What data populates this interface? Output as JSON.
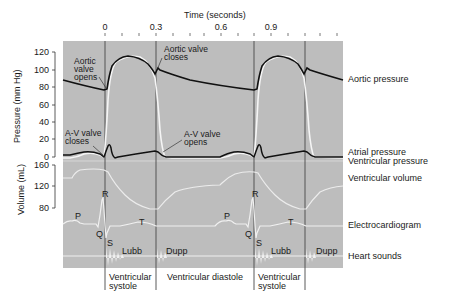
{
  "time_axis": {
    "label": "Time (seconds)",
    "ticks": [
      {
        "label": "0",
        "x": 105
      },
      {
        "label": "0.3",
        "x": 156
      },
      {
        "label": "0.6",
        "x": 221
      },
      {
        "label": "0.9",
        "x": 271
      }
    ]
  },
  "pressure_axis": {
    "label": "Pressure (mm Hg)",
    "ticks": [
      "120",
      "100",
      "80",
      "60",
      "40",
      "20",
      "0"
    ]
  },
  "volume_axis": {
    "label": "Volume (mL)",
    "ticks": [
      "160",
      "120",
      "80"
    ]
  },
  "annotations": {
    "aortic_opens": [
      "Aortic",
      "valve",
      "opens"
    ],
    "aortic_closes": [
      "Aortic valve",
      "closes"
    ],
    "av_closes": [
      "A-V valve",
      "closes"
    ],
    "av_opens": [
      "A-V valve",
      "opens"
    ]
  },
  "trace_labels": {
    "aortic_pressure": "Aortic pressure",
    "atrial_pressure": "Atrial pressure",
    "ventricular_pressure": "Ventricular pressure",
    "ventricular_volume": "Ventricular volume",
    "ecg": "Electrocardiogram",
    "heart_sounds": "Heart sounds"
  },
  "ecg_waves": {
    "p1": "P",
    "q1": "Q",
    "r1": "R",
    "s1": "S",
    "t1": "T",
    "p2": "P",
    "q2": "Q",
    "r2": "R",
    "s2": "S",
    "t2": "T"
  },
  "sounds": {
    "lubb1": "Lubb",
    "dupp1": "Dupp",
    "lubb2": "Lubb",
    "dupp2": "Dupp"
  },
  "phases": {
    "systole1": [
      "Ventricular",
      "systole"
    ],
    "diastole": "Ventricular diastole",
    "systole2": [
      "Ventricular",
      "systole"
    ]
  },
  "colors": {
    "panel": "#b9b9b9",
    "panel_dark": "#a9a9a9",
    "trace_black": "#111111",
    "trace_white": "#f4f4f4",
    "divider": "#4a4a4a"
  }
}
